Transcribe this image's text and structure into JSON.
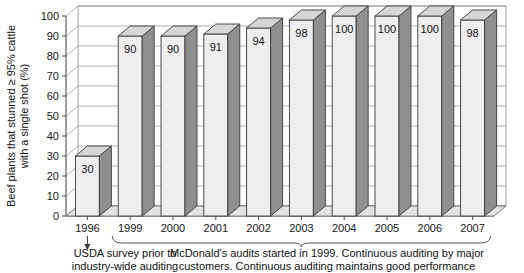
{
  "chart_data": {
    "type": "bar",
    "title": "",
    "subtitle": "",
    "xlabel": "",
    "ylabel": "Beef plants that stunned ≥ 95% cattle with a single shot (%)",
    "ylabel_line1": "Beef plants that stunned ≥ 95% cattle",
    "ylabel_line2": "with a single shot (%)",
    "categories": [
      "1996",
      "1999",
      "2000",
      "2001",
      "2002",
      "2003",
      "2004",
      "2005",
      "2006",
      "2007"
    ],
    "values": [
      30,
      90,
      90,
      91,
      94,
      98,
      100,
      100,
      100,
      98
    ],
    "value_labels": [
      "30",
      "90",
      "90",
      "91",
      "94",
      "98",
      "100",
      "100",
      "100",
      "98"
    ],
    "ylim": [
      0,
      100
    ],
    "ytick_step": 10,
    "yticks": [
      "0",
      "10",
      "20",
      "30",
      "40",
      "50",
      "60",
      "70",
      "80",
      "90",
      "100"
    ],
    "grid": true,
    "grid_axis": "y",
    "legend": false,
    "legend_position": "none",
    "style": "3d-column",
    "colors": {
      "bar_front": "#eeeeee",
      "bar_side": "#8f8f8f",
      "bar_top": "#d6d6d6",
      "bar_outline": "#3a3a3a",
      "gridline": "#8c8c8c",
      "axis": "#4d4d4d",
      "text": "#111111",
      "background": "#ffffff"
    },
    "annotations": {
      "left_caption_line1": "USDA survey prior to",
      "left_caption_line2": "industry-wide auditing",
      "left_caption_marker": "arrow-down",
      "left_caption_target": "1996",
      "right_caption_line1": "McDonald's audits started in 1999. Continuous auditing by major",
      "right_caption_line2": "customers. Continuous auditing maintains good performance",
      "right_caption_marker": "brace",
      "right_caption_span": [
        "1999",
        "2007"
      ]
    }
  }
}
